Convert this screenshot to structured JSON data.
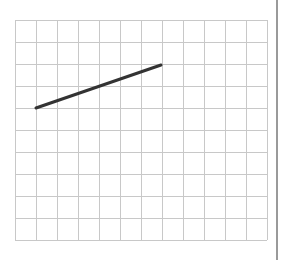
{
  "diagram": {
    "type": "grid-with-line-segment",
    "grid": {
      "columns": 12,
      "rows": 10,
      "left": 15,
      "top": 20,
      "cell_width": 21,
      "cell_height": 22,
      "line_color": "#c8c8c8"
    },
    "segment": {
      "start": {
        "x": 36,
        "y": 108
      },
      "end": {
        "x": 161,
        "y": 65
      },
      "color": "#333333",
      "width": 3
    },
    "right_border_color": "#9a9a9a"
  }
}
